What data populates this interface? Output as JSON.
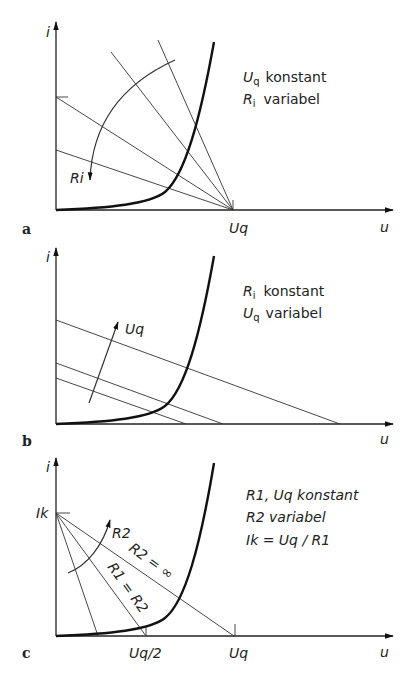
{
  "figure": {
    "panels": [
      {
        "id": "a",
        "label": "a",
        "y_axis_label": "i",
        "x_axis_label": "u",
        "x_tick_label": "Uq",
        "annotation_arrow_label": "Ri",
        "legend_line1_symbol": "U",
        "legend_line1_sub": "q",
        "legend_line1_text": "konstant",
        "legend_line2_symbol": "R",
        "legend_line2_sub": "i",
        "legend_line2_text": "variabel"
      },
      {
        "id": "b",
        "label": "b",
        "y_axis_label": "i",
        "x_axis_label": "u",
        "annotation_arrow_label": "Uq",
        "legend_line1_symbol": "R",
        "legend_line1_sub": "i",
        "legend_line1_text": "konstant",
        "legend_line2_symbol": "U",
        "legend_line2_sub": "q",
        "legend_line2_text": "variabel"
      },
      {
        "id": "c",
        "label": "c",
        "y_axis_label": "i",
        "x_axis_label": "u",
        "y_tick_label": "Ik",
        "x_tick_label_half": "Uq/2",
        "x_tick_label": "Uq",
        "annotation_arrow_label": "R2",
        "line_label_inf": "R2 = ∞",
        "line_label_equal": "R1 = R2",
        "legend_line1": "R1, Uq konstant",
        "legend_line2": "R2 variabel",
        "legend_line3": "Ik = Uq / R1"
      }
    ]
  }
}
